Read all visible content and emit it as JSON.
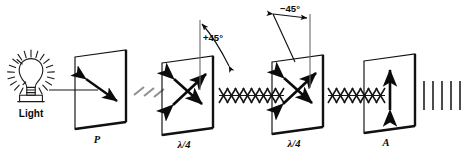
{
  "figure": {
    "background_color": "#ffffff",
    "ink_color": "#111111",
    "ray_color": "#8a8a8a"
  },
  "source": {
    "name": "light-bulb",
    "label": "Light",
    "icon": "lightbulb-icon",
    "rays_count": 20
  },
  "elements": [
    {
      "id": "polarizer",
      "label": "P",
      "role": "polarizer",
      "arrow": "double-headed-diagonal",
      "arrow_angle_deg": -45,
      "angle_label": ""
    },
    {
      "id": "quarter-wave-plate-1",
      "label": "λ/4",
      "role": "quarter-wave-plate",
      "arrow": "crossed-double-headed",
      "arrow_angle_deg": 45,
      "angle_label": "+45°"
    },
    {
      "id": "quarter-wave-plate-2",
      "label": "λ/4",
      "role": "quarter-wave-plate",
      "arrow": "crossed-double-headed",
      "arrow_angle_deg": -45,
      "angle_label": "−45°"
    },
    {
      "id": "analyzer",
      "label": "A",
      "role": "analyzer",
      "arrow": "double-headed-vertical",
      "arrow_angle_deg": 90,
      "angle_label": ""
    }
  ],
  "beams": [
    {
      "id": "beam-source-to-p",
      "style": "straight-gray-ray",
      "between": [
        "Light",
        "P"
      ]
    },
    {
      "id": "beam-p-to-q1",
      "style": "linear-polarized-slashes",
      "between": [
        "P",
        "λ/4"
      ],
      "count": 3
    },
    {
      "id": "beam-q1-to-q2",
      "style": "circular-polarized-helix",
      "between": [
        "λ/4",
        "λ/4"
      ],
      "turns": 9
    },
    {
      "id": "beam-q2-to-a",
      "style": "circular-polarized-helix",
      "between": [
        "λ/4",
        "A"
      ],
      "turns": 8
    },
    {
      "id": "beam-a-out",
      "style": "linear-polarized-bars",
      "between": [
        "A",
        "output"
      ],
      "count": 5
    }
  ],
  "annotations": {
    "angle_1": "+45°",
    "angle_2": "−45°"
  }
}
